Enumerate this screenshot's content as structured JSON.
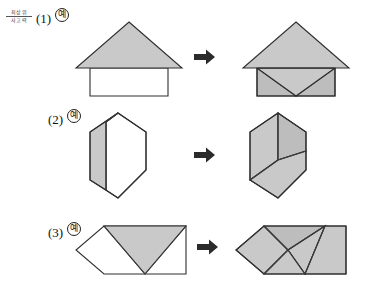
{
  "brand": {
    "line1": "최상위",
    "line2": "사고력"
  },
  "colors": {
    "shape_fill": "#c9c9c9",
    "shape_fill_dark": "#bdbdbd",
    "shape_stroke": "#2e2e2e",
    "empty_fill": "#ffffff",
    "arrow": "#2b2b2b",
    "page_background": "#ffffff"
  },
  "rows": [
    {
      "number": "(1)",
      "example_badge": "예",
      "before": {
        "name": "house-outline-triangle-over-square",
        "description": "Shaded triangle roof over an empty square"
      },
      "arrow": "right-arrow",
      "after": {
        "name": "house-filled-decomposed",
        "description": "Triangle roof over square split into three triangles, all shaded"
      }
    },
    {
      "number": "(2)",
      "example_badge": "예",
      "before": {
        "name": "hexagon-half-shaded",
        "description": "Hexagon with left rhombus shaded and right part empty"
      },
      "arrow": "right-arrow",
      "after": {
        "name": "hexagon-three-rhombi",
        "description": "Hexagon split into three shaded rhombi"
      }
    },
    {
      "number": "(3)",
      "example_badge": "예",
      "before": {
        "name": "pentagon-rectangle-one-triangle",
        "description": "Rectangle with angled left end, one shaded downward triangle"
      },
      "arrow": "right-arrow",
      "after": {
        "name": "pentagon-rectangle-decomposed",
        "description": "Same outline fully shaded and split into four triangles"
      }
    }
  ]
}
